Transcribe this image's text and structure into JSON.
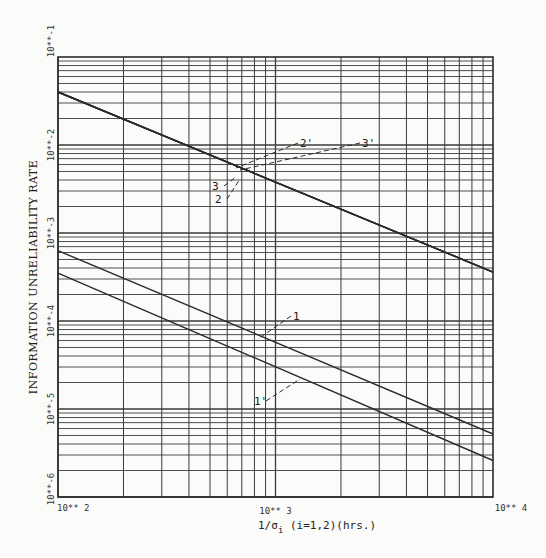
{
  "chart_data": {
    "type": "line",
    "title": "",
    "xlabel": "1/σ_i (i=1,2)(hrs.)",
    "xlabel_parts": {
      "prefix": "1/σ",
      "subscript": "i",
      "suffix": " (i=1,2)(hrs.)"
    },
    "ylabel": "INFORMATION UNRELIABILITY RATE",
    "xscale": "log",
    "yscale": "log",
    "xlim": [
      100,
      10000
    ],
    "ylim": [
      1e-06,
      0.1
    ],
    "grid": true,
    "legend": "none (curves labeled inline)",
    "x_tick_labels": [
      "10** 2",
      "10** 3",
      "10** 4"
    ],
    "y_tick_labels": [
      "10**-1",
      "10**-2",
      "10**-3",
      "10**-4",
      "10**-5",
      "10**-6"
    ],
    "x": [
      100,
      10000
    ],
    "series": [
      {
        "name": "2",
        "values": [
          0.04,
          0.00036
        ]
      },
      {
        "name": "2'",
        "values": [
          0.04,
          0.00036
        ]
      },
      {
        "name": "3",
        "values": [
          0.04,
          0.00036
        ]
      },
      {
        "name": "3'",
        "values": [
          0.04,
          0.00036
        ]
      },
      {
        "name": "1",
        "values": [
          0.00063,
          5.2e-06
        ]
      },
      {
        "name": "1'",
        "values": [
          0.00035,
          2.6e-06
        ]
      }
    ],
    "annotations": [
      {
        "label": "2'",
        "x_px": 300,
        "y_px": 147
      },
      {
        "label": "3'",
        "x_px": 362,
        "y_px": 147
      },
      {
        "label": "3",
        "x_px": 212,
        "y_px": 190
      },
      {
        "label": "2",
        "x_px": 215,
        "y_px": 203
      },
      {
        "label": "1",
        "x_px": 293,
        "y_px": 320
      },
      {
        "label": "1'",
        "x_px": 254,
        "y_px": 405
      }
    ]
  },
  "layout": {
    "plot": {
      "left": 58,
      "top": 57,
      "right": 493,
      "bottom": 497
    },
    "colors": {
      "line": "#2b2b2b",
      "grid": "#3a3a3a",
      "background": "#fbfbf9"
    }
  }
}
